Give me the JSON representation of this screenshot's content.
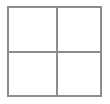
{
  "figure": {
    "name": "2x2 grid square",
    "border_color": "#8c8c8c",
    "line_color": "#8c8c8c",
    "fill_color": "#ffffff",
    "background_color": "#ffffff",
    "border_width_px": 2,
    "divider_width_px": 2,
    "width_px": 95,
    "height_px": 91,
    "rows": 2,
    "columns": 2,
    "cells": [
      {
        "position": "top-left",
        "label": ""
      },
      {
        "position": "top-right",
        "label": ""
      },
      {
        "position": "bottom-left",
        "label": ""
      },
      {
        "position": "bottom-right",
        "label": ""
      }
    ]
  }
}
